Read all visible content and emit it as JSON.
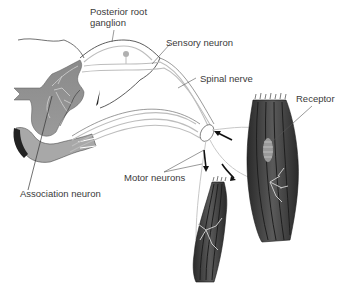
{
  "diagram": {
    "labels": {
      "posterior_root_ganglion_line1": "Posterior root",
      "posterior_root_ganglion_line2": "ganglion",
      "sensory_neuron": "Sensory neuron",
      "spinal_nerve": "Spinal nerve",
      "receptor": "Receptor",
      "motor_neurons": "Motor neurons",
      "association_neuron": "Association neuron"
    },
    "colors": {
      "gray_matter": "#7a7a7a",
      "white_matter": "#ffffff",
      "muscle_dark": "#4a4a4a",
      "muscle_fiber": "#1e1e1e",
      "nerve_fiber": "#c8c8c8",
      "outline": "#333333",
      "leader_line": "#555555",
      "arrow": "#111111",
      "label_text": "#3a3a3a"
    }
  }
}
